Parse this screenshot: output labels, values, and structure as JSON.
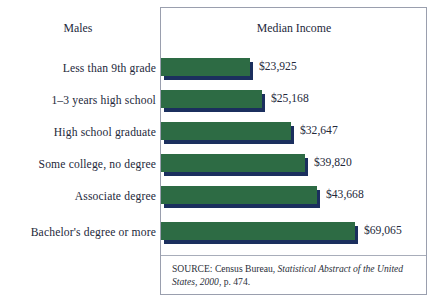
{
  "header": {
    "left_label": "Males",
    "chart_title": "Median Income"
  },
  "source": {
    "prefix": "SOURCE: Census Bureau, ",
    "italic_part": "Statistical Abstract of the United States, 2000",
    "suffix": ", p. 474."
  },
  "colors": {
    "bar_green": "#2d6b44",
    "bar_shadow_navy": "#1b2f5e",
    "box_border": "#9a9fae",
    "text": "#23283a"
  },
  "chart_data": {
    "type": "bar",
    "orientation": "horizontal",
    "title": "Median Income",
    "subtitle": "Males",
    "xlabel": "",
    "ylabel": "",
    "grid": false,
    "legend": "none",
    "xlim": [
      0,
      80000
    ],
    "categories": [
      "Less than 9th grade",
      "1–3 years high school",
      "High school graduate",
      "Some college, no degree",
      "Associate degree",
      "Bachelor's degree or more"
    ],
    "values": [
      23925,
      25168,
      32647,
      39820,
      43668,
      69065
    ],
    "value_labels": [
      "$23,925",
      "$25,168",
      "$32,647",
      "$39,820",
      "$43,668",
      "$69,065"
    ],
    "bar_pixel_widths": [
      89,
      101,
      130,
      144,
      156,
      194
    ],
    "bar_tops": [
      58,
      90,
      122,
      154,
      186,
      222
    ],
    "label_tops": [
      60,
      92,
      124,
      156,
      188,
      224
    ]
  }
}
